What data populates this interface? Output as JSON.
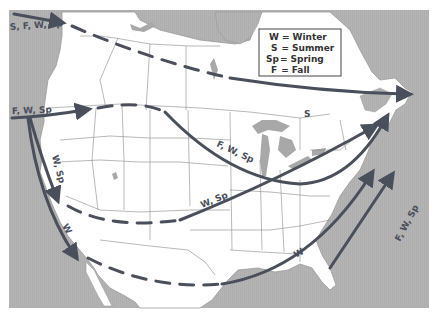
{
  "map": {
    "title": "",
    "colors": {
      "water": "#b4b4b4",
      "land": "#ffffff",
      "border_lines": "#8a8a8a",
      "lakes": "#a8a8a8",
      "route": "#4a4f5c"
    }
  },
  "legend": {
    "items": [
      {
        "abbr": "W",
        "eq": "=",
        "label": "Winter"
      },
      {
        "abbr": "S",
        "eq": "=",
        "label": "Summer"
      },
      {
        "abbr": "Sp",
        "eq": "=",
        "label": "Spring"
      },
      {
        "abbr": "F",
        "eq": "=",
        "label": "Fall"
      }
    ]
  },
  "routes": [
    {
      "id": "northern-pacific",
      "label": "S, F, W, Sp",
      "style": "dashed-then-solid"
    },
    {
      "id": "summer-north",
      "label": "S",
      "style": "solid"
    },
    {
      "id": "central-west",
      "label": "F, W, Sp",
      "style": "solid-then-dashed"
    },
    {
      "id": "great-lakes",
      "label": "F, W, Sp",
      "style": "solid"
    },
    {
      "id": "california-inland",
      "label": "W, Sp",
      "style": "solid"
    },
    {
      "id": "southwest-east",
      "label": "W, Sp",
      "style": "dashed-then-solid"
    },
    {
      "id": "pacific-coast",
      "label": "W",
      "style": "solid"
    },
    {
      "id": "gulf-coast",
      "label": "W",
      "style": "dashed-then-solid"
    },
    {
      "id": "atlantic-offshore",
      "label": "F, W, Sp",
      "style": "solid"
    }
  ]
}
